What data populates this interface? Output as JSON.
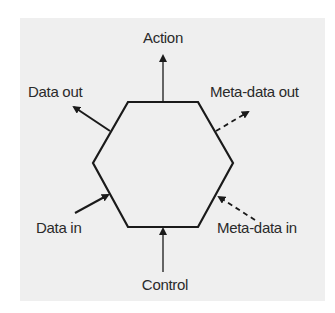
{
  "diagram": {
    "type": "hexagon-interface",
    "labels": {
      "action": "Action",
      "data_out": "Data out",
      "meta_data_out": "Meta-data out",
      "data_in": "Data in",
      "meta_data_in": "Meta-data in",
      "control": "Control"
    },
    "colors": {
      "line": "#1a1a1a",
      "background": "#efefef"
    }
  }
}
